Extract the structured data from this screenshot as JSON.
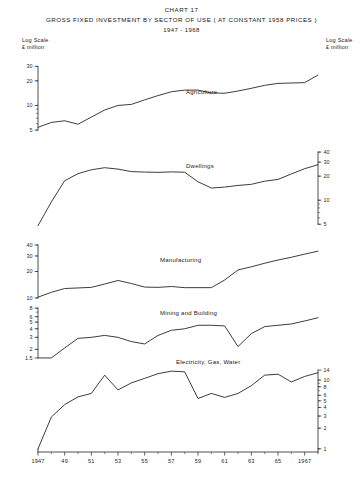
{
  "header": {
    "chart_number": "CHART 17",
    "title": "GROSS FIXED INVESTMENT BY SECTOR OF USE ( AT CONSTANT 1958 PRICES )",
    "period": "1947 - 1968",
    "left_scale_line1": "Log Scale",
    "left_scale_line2": "£ million",
    "right_scale_line1": "Log Scale",
    "right_scale_line2": "£ million"
  },
  "axis": {
    "year_ticks": [
      "1947",
      "49",
      "51",
      "53",
      "55",
      "57",
      "59",
      "61",
      "63",
      "65",
      "1967"
    ],
    "year_values": [
      1947,
      1949,
      1951,
      1953,
      1955,
      1957,
      1959,
      1961,
      1963,
      1965,
      1967
    ],
    "x_min": 1947,
    "x_max": 1968
  },
  "chart_data": {
    "type": "line",
    "title": "GROSS FIXED INVESTMENT BY SECTOR OF USE ( AT CONSTANT 1958 PRICES )",
    "subtitle": "1947 - 1968",
    "xlabel": "",
    "ylabel": "Log Scale £ million",
    "grid": false,
    "legend": "inline-annotations",
    "scale": "logarithmic",
    "x": [
      1947,
      1948,
      1949,
      1950,
      1951,
      1952,
      1953,
      1954,
      1955,
      1956,
      1957,
      1958,
      1959,
      1960,
      1961,
      1962,
      1963,
      1964,
      1965,
      1966,
      1967,
      1968
    ],
    "panels": [
      {
        "name": "Agriculture",
        "label": "Agriculture",
        "axis_side": "left",
        "ticks": [
          5,
          10,
          20,
          30
        ],
        "ylim": [
          4,
          38
        ],
        "values": [
          5.4,
          6.2,
          6.5,
          5.9,
          7.2,
          8.8,
          10.0,
          10.3,
          11.7,
          13.2,
          14.7,
          15.4,
          15.4,
          14.2,
          14.1,
          15.0,
          16.2,
          17.6,
          18.6,
          18.8,
          19.0,
          23.5
        ]
      },
      {
        "name": "Dwellings",
        "label": "Dwellings",
        "axis_side": "right",
        "ticks": [
          5,
          10,
          20,
          30,
          40
        ],
        "ylim": [
          4,
          45
        ],
        "values": [
          4.8,
          9.5,
          17.5,
          21.5,
          24.0,
          25.5,
          24.5,
          22.8,
          22.5,
          22.3,
          22.6,
          22.4,
          17.0,
          14.2,
          14.6,
          15.3,
          15.8,
          17.3,
          18.2,
          21.3,
          24.8,
          27.8
        ]
      },
      {
        "name": "Manufacturing",
        "label": "Manufacturing",
        "axis_side": "left",
        "ticks": [
          10,
          20,
          30,
          40
        ],
        "ylim": [
          9,
          48
        ],
        "values": [
          10.2,
          11.6,
          12.8,
          13.0,
          13.2,
          14.4,
          15.8,
          14.6,
          13.3,
          13.2,
          13.5,
          13.1,
          13.1,
          13.1,
          16.0,
          20.8,
          22.6,
          24.8,
          27.0,
          29.0,
          31.5,
          34.0
        ]
      },
      {
        "name": "Mining and Building",
        "label": "Mining and Building",
        "axis_side": "left",
        "ticks": [
          1.5,
          2,
          3,
          4,
          5,
          6,
          8
        ],
        "ylim": [
          1.4,
          8.6
        ],
        "values": [
          1.5,
          1.5,
          2.1,
          2.9,
          3.0,
          3.2,
          3.0,
          2.6,
          2.4,
          3.2,
          3.8,
          4.0,
          4.5,
          4.5,
          4.4,
          2.2,
          3.4,
          4.3,
          4.5,
          4.7,
          5.2,
          5.8
        ]
      },
      {
        "name": "Electricity, Gas, Water",
        "label": "Electricity, Gas, Water",
        "axis_side": "right",
        "ticks": [
          1,
          2,
          3,
          4,
          5,
          6,
          8,
          10,
          14
        ],
        "ylim": [
          0.9,
          15
        ],
        "values": [
          1.0,
          2.9,
          4.4,
          5.7,
          6.4,
          11.8,
          7.2,
          9.1,
          10.6,
          12.4,
          13.5,
          13.2,
          5.4,
          6.4,
          5.6,
          6.4,
          8.3,
          11.8,
          12.2,
          9.4,
          11.3,
          12.8
        ]
      }
    ]
  }
}
